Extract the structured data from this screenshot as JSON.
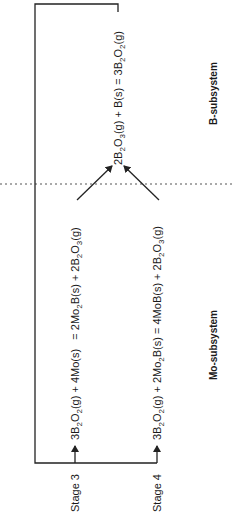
{
  "diagram": {
    "title": "",
    "orientation": "rotated -90deg (text reads bottom-to-top)",
    "colors": {
      "line": "#222222",
      "text": "#1a1a1a",
      "background": "#ffffff"
    },
    "subsystems": {
      "b": {
        "label": "B-subsystem"
      },
      "mo": {
        "label": "Mo-subsystem"
      }
    },
    "stages": [
      {
        "label": "Stage 3",
        "reaction": {
          "parts": [
            {
              "t": "3B"
            },
            {
              "t": "2",
              "sub": true
            },
            {
              "t": "O"
            },
            {
              "t": "2",
              "sub": true
            },
            {
              "t": "(g) + 4Mo(s)   = 2Mo"
            },
            {
              "t": "2",
              "sub": true
            },
            {
              "t": "B(s) + 2B"
            },
            {
              "t": "2",
              "sub": true
            },
            {
              "t": "O"
            },
            {
              "t": "3",
              "sub": true
            },
            {
              "t": "(g)"
            }
          ],
          "text": "3B2O2(g) + 4Mo(s) = 2Mo2B(s) + 2B2O3(g)"
        }
      },
      {
        "label": "Stage 4",
        "reaction": {
          "parts": [
            {
              "t": "3B"
            },
            {
              "t": "2",
              "sub": true
            },
            {
              "t": "O"
            },
            {
              "t": "2",
              "sub": true
            },
            {
              "t": "(g) + 2Mo"
            },
            {
              "t": "2",
              "sub": true
            },
            {
              "t": "B(s) = 4MoB(s) + 2B"
            },
            {
              "t": "2",
              "sub": true
            },
            {
              "t": "O"
            },
            {
              "t": "3",
              "sub": true
            },
            {
              "t": "(g)"
            }
          ],
          "text": "3B2O2(g) + 2Mo2B(s) = 4MoB(s) + 2B2O3(g)"
        }
      }
    ],
    "b_reaction": {
      "parts": [
        {
          "t": "2B"
        },
        {
          "t": "2",
          "sub": true
        },
        {
          "t": "O"
        },
        {
          "t": "3",
          "sub": true
        },
        {
          "t": "(g) + B(s) = 3B"
        },
        {
          "t": "2",
          "sub": true
        },
        {
          "t": "O"
        },
        {
          "t": "2",
          "sub": true
        },
        {
          "t": "(g)"
        }
      ],
      "text": "2B2O3(g) + B(s) = 3B2O2(g)"
    }
  }
}
